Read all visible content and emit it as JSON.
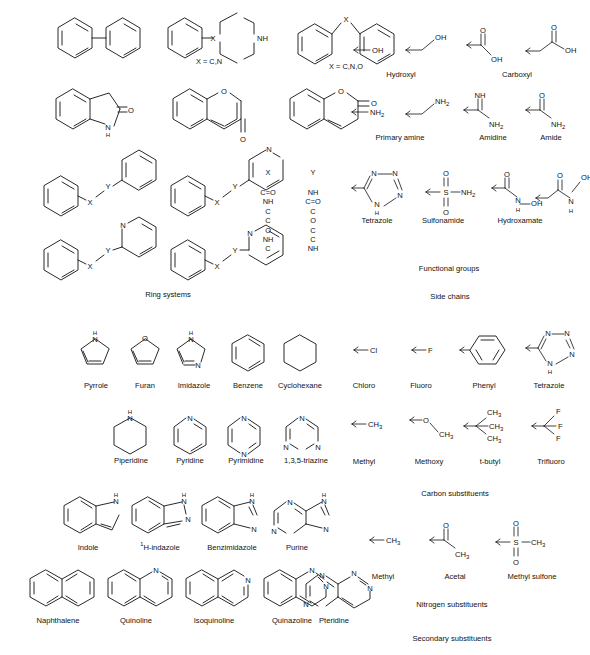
{
  "figure": {
    "background_color": "#ffffff",
    "line_color": "#111111",
    "sections": [
      {
        "name": "ring-systems",
        "caption": "Ring systems"
      },
      {
        "name": "side-chains",
        "caption": "Side chains"
      },
      {
        "name": "functional-groups",
        "caption": "Functional groups"
      },
      {
        "name": "secondary-substituents",
        "caption": "Secondary substituents"
      },
      {
        "name": "carbon-substituents",
        "caption": "Carbon substituents"
      },
      {
        "name": "nitrogen-substituents",
        "caption": "Nitrogen substituents"
      }
    ]
  },
  "ring_systems": {
    "caption": "Ring systems",
    "row1": [
      {
        "name": "biphenyl",
        "label": ""
      },
      {
        "name": "phenyl-piperazine",
        "label": "X = C,N"
      },
      {
        "name": "diaryl-x",
        "label": "X = C,N,O"
      }
    ],
    "row2": [
      {
        "name": "oxindole",
        "label": ""
      },
      {
        "name": "chromone",
        "label": ""
      },
      {
        "name": "coumarin",
        "label": ""
      }
    ],
    "row3": [
      {
        "name": "phenyl-x-y-phenyl",
        "label": ""
      },
      {
        "name": "phenyl-x-y-pyridin-4-yl",
        "label": ""
      }
    ],
    "row4": [
      {
        "name": "phenyl-x-y-pyridin-3-yl",
        "label": ""
      },
      {
        "name": "phenyl-x-y-pyridin-2-yl",
        "label": ""
      }
    ],
    "linker_table": {
      "header_x": "X",
      "header_y": "Y",
      "x_values": [
        "C=O",
        "NH",
        "C",
        "C",
        "O",
        "NH",
        "C"
      ],
      "y_values": [
        "NH",
        "C=O",
        "C",
        "O",
        "C",
        "C",
        "NH"
      ]
    }
  },
  "side_chains": {
    "caption": "Side chains",
    "functional_groups_caption": "Functional groups",
    "row1": [
      {
        "name": "hydroxyl",
        "label": "Hydroxyl",
        "atoms": [
          "OH"
        ]
      },
      {
        "name": "carboxyl",
        "label": "Carboxyl",
        "atoms": [
          "O",
          "OH"
        ]
      }
    ],
    "row2": [
      {
        "name": "primary-amine",
        "label": "Primary amine",
        "atoms": [
          "NH2"
        ]
      },
      {
        "name": "amidine",
        "label": "Amidine",
        "atoms": [
          "NH",
          "NH2"
        ]
      },
      {
        "name": "amide",
        "label": "Amide",
        "atoms": [
          "O",
          "NH2"
        ]
      }
    ],
    "row3": [
      {
        "name": "tetrazole",
        "label": "Tetrazole",
        "atoms": [
          "N",
          "N",
          "N",
          "N",
          "H"
        ]
      },
      {
        "name": "sulfonamide",
        "label": "Sulfonamide",
        "atoms": [
          "O",
          "S",
          "O",
          "NH2"
        ]
      },
      {
        "name": "hydroxamate",
        "label": "Hydroxamate",
        "atoms": [
          "O",
          "N",
          "H",
          "OH"
        ]
      }
    ]
  },
  "secondary_substituents": {
    "caption": "Secondary substituents",
    "carbon_caption": "Carbon substituents",
    "nitrogen_caption": "Nitrogen substituents",
    "monocyclic_row1": [
      {
        "name": "pyrrole",
        "label": "Pyrrole",
        "heteroatoms": [
          "N",
          "H"
        ]
      },
      {
        "name": "furan",
        "label": "Furan",
        "heteroatoms": [
          "O"
        ]
      },
      {
        "name": "imidazole",
        "label": "Imidazole",
        "heteroatoms": [
          "N",
          "H",
          "N"
        ]
      },
      {
        "name": "benzene",
        "label": "Benzene",
        "heteroatoms": []
      },
      {
        "name": "cyclohexane",
        "label": "Cyclohexane",
        "heteroatoms": []
      }
    ],
    "monocyclic_row2": [
      {
        "name": "piperidine",
        "label": "Piperidine",
        "heteroatoms": [
          "N",
          "H"
        ]
      },
      {
        "name": "pyridine",
        "label": "Pyridine",
        "heteroatoms": [
          "N"
        ]
      },
      {
        "name": "pyrimidine",
        "label": "Pyrimidine",
        "heteroatoms": [
          "N",
          "N"
        ]
      },
      {
        "name": "triazine",
        "label": "1,3,5-triazine",
        "heteroatoms": [
          "N",
          "N",
          "N"
        ]
      }
    ],
    "bicyclic_row1": [
      {
        "name": "indole",
        "label": "Indole",
        "label_sup": "",
        "heteroatoms": [
          "N",
          "H"
        ]
      },
      {
        "name": "indazole",
        "label": "H-indazole",
        "label_sup": "1",
        "heteroatoms": [
          "N",
          "H",
          "N"
        ]
      },
      {
        "name": "benzimidazole",
        "label": "Benzimidazole",
        "label_sup": "",
        "heteroatoms": [
          "N",
          "H",
          "N"
        ]
      },
      {
        "name": "purine",
        "label": "Purine",
        "label_sup": "",
        "heteroatoms": [
          "N",
          "N",
          "N",
          "H",
          "N"
        ]
      }
    ],
    "bicyclic_row2": [
      {
        "name": "naphthalene",
        "label": "Naphthalene",
        "heteroatoms": []
      },
      {
        "name": "quinoline",
        "label": "Quinoline",
        "heteroatoms": [
          "N"
        ]
      },
      {
        "name": "isoquinoline",
        "label": "Isoquinoline",
        "heteroatoms": [
          "N"
        ]
      },
      {
        "name": "quinazoline",
        "label": "Quinazoline",
        "heteroatoms": [
          "N",
          "N"
        ]
      },
      {
        "name": "pteridine",
        "label": "Pteridine",
        "heteroatoms": [
          "N",
          "N",
          "N",
          "N"
        ]
      }
    ],
    "carbon_row1": [
      {
        "name": "chloro",
        "label": "Chloro",
        "atoms": [
          "Cl"
        ]
      },
      {
        "name": "fluoro",
        "label": "Fluoro",
        "atoms": [
          "F"
        ]
      },
      {
        "name": "phenyl",
        "label": "Phenyl",
        "atoms": []
      },
      {
        "name": "tetrazole-sub",
        "label": "Tetrazole",
        "atoms": [
          "N",
          "N",
          "N",
          "N",
          "H"
        ]
      }
    ],
    "carbon_row2": [
      {
        "name": "methyl",
        "label": "Methyl",
        "atoms": [
          "CH3"
        ]
      },
      {
        "name": "methoxy",
        "label": "Methoxy",
        "atoms": [
          "O",
          "CH3"
        ]
      },
      {
        "name": "t-butyl",
        "label": "t-butyl",
        "atoms": [
          "CH3",
          "CH3",
          "CH3"
        ]
      },
      {
        "name": "trifluoro",
        "label": "Trifluoro",
        "atoms": [
          "F",
          "F",
          "F"
        ]
      }
    ],
    "nitrogen_row": [
      {
        "name": "n-methyl",
        "label": "Methyl",
        "atoms": [
          "CH3"
        ]
      },
      {
        "name": "acetal",
        "label": "Acetal",
        "atoms": [
          "O",
          "CH3"
        ]
      },
      {
        "name": "methyl-sulfone",
        "label": "Methyl sulfone",
        "atoms": [
          "O",
          "S",
          "O",
          "CH3"
        ]
      }
    ]
  }
}
